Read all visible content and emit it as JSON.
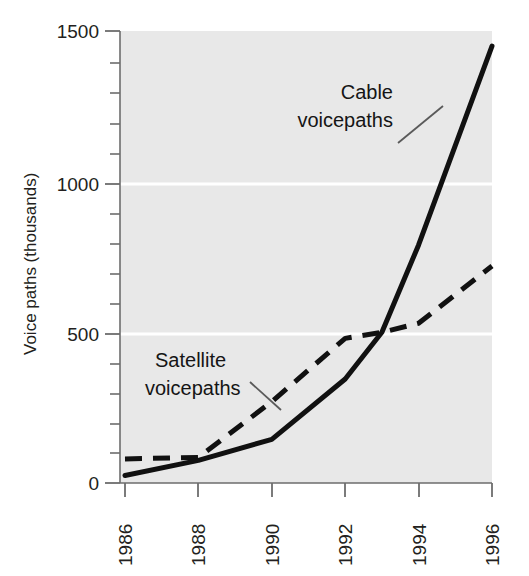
{
  "chart_data": {
    "type": "line",
    "title": "",
    "subtitle": "",
    "xlabel": "",
    "ylabel": "Voice paths (thousands)",
    "x": [
      1986,
      1988,
      1990,
      1992,
      1994,
      1996
    ],
    "xtick_labels": [
      "1986",
      "1988",
      "1990",
      "1992",
      "1994",
      "1996"
    ],
    "ytick_labels": [
      "0",
      "500",
      "1000",
      "1500"
    ],
    "ytick_values": [
      0,
      500,
      1000,
      1500
    ],
    "xlim": [
      1986,
      1996
    ],
    "ylim": [
      0,
      1500
    ],
    "y_minor_tick_interval": 100,
    "grid": "horizontal-major-only",
    "legend_position": "inline-annotations",
    "plot_background_color": "#e8e8e8",
    "gridline_color": "#ffffff",
    "axis_color": "#6d6d6d",
    "series": [
      {
        "name": "Cable voicepaths",
        "style": "solid",
        "color": "#111111",
        "x": [
          1986,
          1988,
          1990,
          1992,
          1993,
          1994,
          1996
        ],
        "values": [
          25,
          75,
          145,
          345,
          500,
          790,
          1450
        ]
      },
      {
        "name": "Satellite voicepaths",
        "style": "dashed",
        "color": "#111111",
        "x": [
          1986,
          1988,
          1990,
          1992,
          1993,
          1994,
          1996
        ],
        "values": [
          80,
          85,
          270,
          480,
          500,
          530,
          720
        ]
      }
    ],
    "annotations": [
      {
        "id": "cable",
        "text_line1": "Cable",
        "text_line2": "voicepaths",
        "leader_from": [
          398,
          143
        ],
        "leader_to": [
          440,
          110
        ]
      },
      {
        "id": "satellite",
        "text_line1": "Satellite",
        "text_line2": "voicepaths",
        "leader_from": [
          275,
          408
        ],
        "leader_to": [
          240,
          382
        ]
      }
    ]
  },
  "axis": {
    "y_title": "Voice paths (thousands)",
    "y_ticks": [
      "1500",
      "1000",
      "500",
      "0"
    ],
    "x_ticks": [
      "1986",
      "1988",
      "1990",
      "1992",
      "1994",
      "1996"
    ]
  },
  "annotations": {
    "cable": {
      "line1": "Cable",
      "line2": "voicepaths"
    },
    "satellite": {
      "line1": "Satellite",
      "line2": "voicepaths"
    }
  },
  "colors": {
    "plot_background": "#e8e8e8",
    "gridline": "#ffffff",
    "axis": "#6d6d6d",
    "series_line": "#111111",
    "text": "#231f20"
  }
}
